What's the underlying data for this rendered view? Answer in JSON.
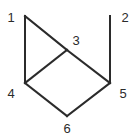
{
  "diagram": {
    "type": "graph",
    "nodes": [
      {
        "id": "1",
        "label": "1",
        "x": 25,
        "y": 16,
        "lx": 11,
        "ly": 22
      },
      {
        "id": "2",
        "label": "2",
        "x": 110,
        "y": 16,
        "lx": 125,
        "ly": 22
      },
      {
        "id": "3",
        "label": "3",
        "x": 67,
        "y": 50,
        "lx": 76,
        "ly": 45
      },
      {
        "id": "4",
        "label": "4",
        "x": 25,
        "y": 83,
        "lx": 11,
        "ly": 98
      },
      {
        "id": "5",
        "label": "5",
        "x": 110,
        "y": 83,
        "lx": 123,
        "ly": 98
      },
      {
        "id": "6",
        "label": "6",
        "x": 67,
        "y": 116,
        "lx": 67,
        "ly": 133
      }
    ],
    "edges": [
      {
        "from": "1",
        "to": "4"
      },
      {
        "from": "1",
        "to": "3"
      },
      {
        "from": "3",
        "to": "5"
      },
      {
        "from": "3",
        "to": "4"
      },
      {
        "from": "2",
        "to": "5"
      },
      {
        "from": "4",
        "to": "6"
      },
      {
        "from": "6",
        "to": "5"
      }
    ],
    "colors": {
      "stroke": "#2b2b2b",
      "background": "#ffffff"
    }
  }
}
